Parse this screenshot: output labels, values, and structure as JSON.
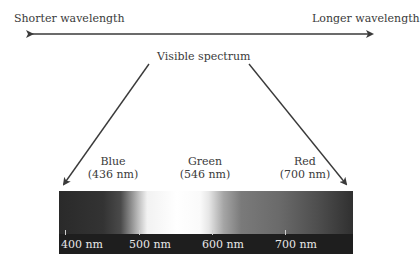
{
  "header": {
    "left_label": "Shorter wavelength",
    "right_label": "Longer wavelength",
    "center_label": "Visible spectrum"
  },
  "peaks": [
    {
      "name": "Blue",
      "value": "(436 nm)"
    },
    {
      "name": "Green",
      "value": "(546 nm)"
    },
    {
      "name": "Red",
      "value": "(700 nm)"
    }
  ],
  "scale": {
    "ticks": [
      "400 nm",
      "500 nm",
      "600 nm",
      "700 nm"
    ]
  },
  "colors": {
    "text": "#3a3a3a",
    "arrow": "#3a3a3a",
    "scale_bar": "#1e1e1e"
  }
}
